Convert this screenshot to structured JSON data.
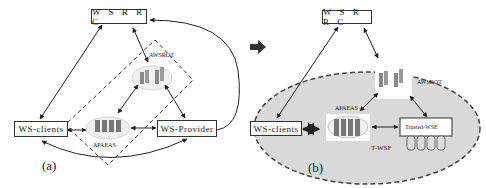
{
  "panel_a": {
    "caption": "(a)",
    "nodes": {
      "wsrrc": "W S R R C",
      "ws_clients": "WS-clients",
      "ws_provider": "WS-Provider",
      "awsrot": "AWSROT",
      "apaeas": "APAEAS"
    }
  },
  "panel_b": {
    "caption": "(b)",
    "nodes": {
      "wsrrc": "W S R R C",
      "ws_clients": "WS-clients",
      "awsrot": "AWSROT",
      "apaeas": "APAEAS",
      "trusted_wse": "Trusted-WSE",
      "t_wsf": "T-WSF"
    }
  },
  "transition_arrow": "right-arrow",
  "colors": {
    "ellipse_fill": "#d9d9d9",
    "line": "#222222",
    "arrow": "#333333"
  }
}
